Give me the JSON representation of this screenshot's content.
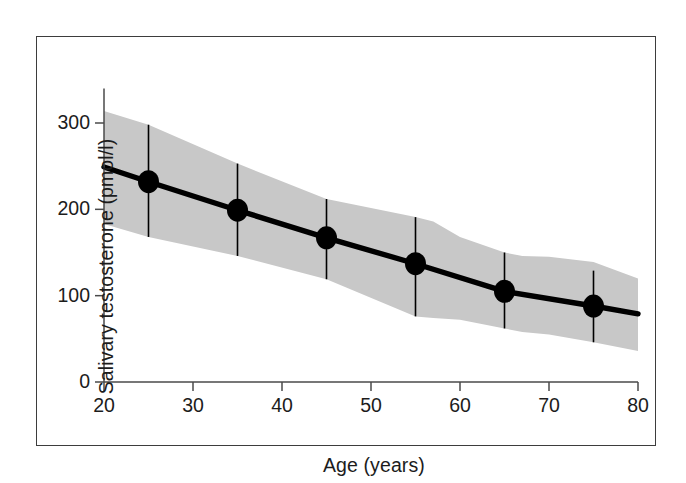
{
  "figure": {
    "background_color": "#ffffff",
    "frame_color": "#3d3d3d",
    "band_color": "#c8c8c8",
    "line_color": "#000000",
    "marker_color": "#000000",
    "text_color": "#1c1c1c"
  },
  "chart_data": {
    "type": "line",
    "title": "",
    "xlabel": "Age (years)",
    "ylabel": "Salivary testosterone (pmol/l)",
    "xlim": [
      20,
      80
    ],
    "ylim": [
      0,
      340
    ],
    "grid": false,
    "legend": "none",
    "x_ticks": [
      20,
      30,
      40,
      50,
      60,
      70,
      80
    ],
    "x_tick_labels": [
      "20",
      "30",
      "40",
      "50",
      "60",
      "70",
      "80"
    ],
    "y_ticks": [
      0,
      100,
      200,
      300
    ],
    "y_tick_labels": [
      "0",
      "100",
      "200",
      "300"
    ],
    "x": [
      25,
      35,
      45,
      55,
      65,
      75
    ],
    "series": [
      {
        "name": "Mean salivary testosterone",
        "values": [
          232,
          199,
          167,
          137,
          105,
          88
        ],
        "marker": "filled-circle",
        "error_bars_low": [
          168,
          146,
          119,
          76,
          62,
          46
        ],
        "error_bars_high": [
          298,
          253,
          212,
          191,
          150,
          129
        ]
      }
    ],
    "band": {
      "name": "Reference range (shaded)",
      "x": [
        20,
        25,
        35,
        45,
        55,
        57,
        60,
        65,
        67,
        70,
        75,
        80
      ],
      "upper": [
        314,
        298,
        253,
        212,
        191,
        186,
        168,
        150,
        146,
        145,
        139,
        120
      ],
      "lower": [
        183,
        168,
        146,
        119,
        76,
        74,
        72,
        62,
        58,
        55,
        46,
        36
      ]
    },
    "line_trend": {
      "x": [
        20,
        25,
        35,
        45,
        55,
        65,
        75,
        80
      ],
      "y": [
        249,
        232,
        199,
        167,
        137,
        105,
        88,
        79
      ]
    }
  }
}
